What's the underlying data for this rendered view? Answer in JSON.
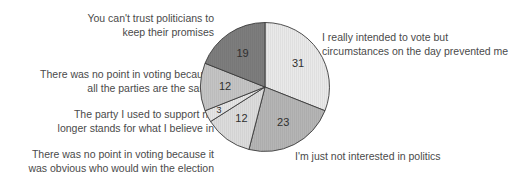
{
  "chart_data": {
    "type": "pie",
    "title": "",
    "subtitle": "",
    "xlabel": "",
    "ylabel": "",
    "legend_position": "callout-labels",
    "grid": false,
    "total": 100,
    "value_suffix": "",
    "categories": [
      "I really intended to vote but circumstances on the day prevented me",
      "I'm just not interested in politics",
      "There was no point in voting because it was obvious who would win the election",
      "The party I used to support no longer stands for what I believe in",
      "There was no point in voting because all the parties are the same",
      "You can't trust politicians to keep their promises"
    ],
    "values": [
      31,
      23,
      12,
      3,
      12,
      19
    ],
    "colors": [
      "#e9e9e9",
      "#b5b5b5",
      "#dcdcdc",
      "#e5e5e5",
      "#c4c4c4",
      "#7d7d7d"
    ],
    "slice_outline_color": "#3c3c3c",
    "background_color": "#ffffff",
    "text_color": "#4a4a4a",
    "slices": [
      {
        "label": "31",
        "value": 31,
        "color": "#e9e9e9",
        "category": "I really intended to vote but circumstances on the day prevented me"
      },
      {
        "label": "23",
        "value": 23,
        "color": "#b5b5b5",
        "category": "I'm just not interested in politics"
      },
      {
        "label": "12",
        "value": 12,
        "color": "#dcdcdc",
        "category": "There was no point in voting because it was obvious who would win the election"
      },
      {
        "label": "3",
        "value": 3,
        "color": "#e5e5e5",
        "category": "The party I used to support no longer stands for what I believe in"
      },
      {
        "label": "12",
        "value": 12,
        "color": "#c4c4c4",
        "category": "There was no point in voting because all the parties are the same"
      },
      {
        "label": "19",
        "value": 19,
        "color": "#7d7d7d",
        "category": "You can't trust politicians to keep their promises"
      }
    ]
  },
  "labels": {
    "promises": "You can't trust politicians to\nkeep their promises",
    "parties": "There was no point in voting because\nall the parties are the same",
    "support": "The party I used to support no\nlonger stands for what I believe in",
    "obvious": "There was no point in voting because it\nwas obvious who would win the election",
    "intended": "I really intended to vote but\ncircumstances on the day prevented me",
    "politics": "I'm just not interested in politics"
  },
  "slice_numbers": {
    "intended": "31",
    "politics": "23",
    "obvious": "12",
    "support": "3",
    "parties": "12",
    "promises": "19"
  }
}
